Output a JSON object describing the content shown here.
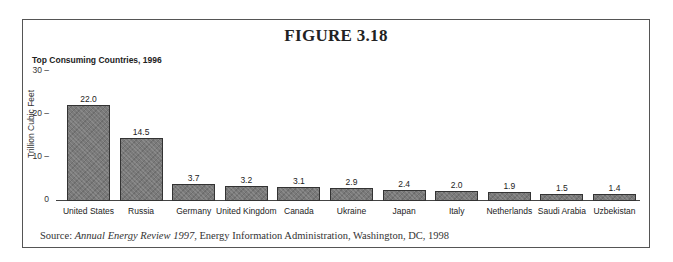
{
  "figure": {
    "label": "FIGURE 3.18",
    "source_prefix": "Source: ",
    "source_title": "Annual Energy Review 1997",
    "source_rest": ", Energy Information Administration, Washington, DC, 1998"
  },
  "chart_data": {
    "type": "bar",
    "title": "Top Consuming Countries, 1996",
    "xlabel": "",
    "ylabel": "Trillion Cubic Feet",
    "ylim": [
      0,
      30
    ],
    "yticks": [
      0,
      10,
      20,
      30
    ],
    "grid": false,
    "legend": null,
    "categories": [
      "United States",
      "Russia",
      "Germany",
      "United Kingdom",
      "Canada",
      "Ukraine",
      "Japan",
      "Italy",
      "Netherlands",
      "Saudi Arabia",
      "Uzbekistan"
    ],
    "values": [
      22.0,
      14.5,
      3.7,
      3.2,
      3.1,
      2.9,
      2.4,
      2.0,
      1.9,
      1.5,
      1.4
    ],
    "value_labels": [
      "22.0",
      "14.5",
      "3.7",
      "3.2",
      "3.1",
      "2.9",
      "2.4",
      "2.0",
      "1.9",
      "1.5",
      "1.4"
    ],
    "bar_color": "#7a7a7a"
  }
}
